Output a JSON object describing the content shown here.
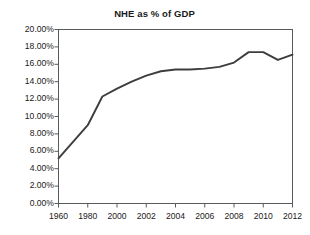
{
  "chart_data": {
    "type": "line",
    "title": "NHE as % of GDP",
    "xlabel": "",
    "ylabel": "",
    "categories": [
      "1960",
      "1980",
      "2000",
      "2002",
      "2004",
      "2006",
      "2008",
      "2010",
      "2012"
    ],
    "x_tick_labels": [
      "1960",
      "1980",
      "2000",
      "2002",
      "2004",
      "2006",
      "2008",
      "2010",
      "2012"
    ],
    "y_tick_labels": [
      "20.00%",
      "18.00%",
      "16.00%",
      "14.00%",
      "12.00%",
      "10.00%",
      "8.00%",
      "6.00%",
      "4.00%",
      "2.00%",
      "0.00%"
    ],
    "y_tick_values": [
      20,
      18,
      16,
      14,
      12,
      10,
      8,
      6,
      4,
      2,
      0
    ],
    "ylim": [
      0,
      20
    ],
    "grid": false,
    "legend": false,
    "series": [
      {
        "name": "NHE as % of GDP",
        "color": "#3d3d3d",
        "points": [
          {
            "x": "1960",
            "xpos": 0,
            "value": 5.2
          },
          {
            "x": "1980",
            "xpos": 1,
            "value": 9.0
          },
          {
            "x": "1990",
            "xpos": 1.5,
            "value": 12.3
          },
          {
            "x": "2000",
            "xpos": 2,
            "value": 13.2
          },
          {
            "x": "2001",
            "xpos": 2.5,
            "value": 14.0
          },
          {
            "x": "2002",
            "xpos": 3,
            "value": 14.7
          },
          {
            "x": "2003",
            "xpos": 3.5,
            "value": 15.2
          },
          {
            "x": "2004",
            "xpos": 4,
            "value": 15.4
          },
          {
            "x": "2005",
            "xpos": 4.5,
            "value": 15.4
          },
          {
            "x": "2006",
            "xpos": 5,
            "value": 15.5
          },
          {
            "x": "2007",
            "xpos": 5.5,
            "value": 15.7
          },
          {
            "x": "2008",
            "xpos": 6,
            "value": 16.2
          },
          {
            "x": "2009",
            "xpos": 6.5,
            "value": 17.4
          },
          {
            "x": "2010",
            "xpos": 7,
            "value": 17.4
          },
          {
            "x": "2011",
            "xpos": 7.5,
            "value": 16.5
          },
          {
            "x": "2012",
            "xpos": 8,
            "value": 17.1
          }
        ]
      }
    ]
  },
  "colors": {
    "line": "#3d3d3d",
    "axis": "#5a5a5a",
    "text": "#1a1a1a",
    "background": "#ffffff"
  }
}
